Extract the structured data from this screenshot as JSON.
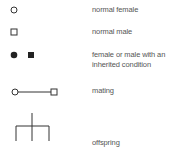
{
  "legend": {
    "items": [
      {
        "symbol": "open-circle",
        "label": "normal female"
      },
      {
        "symbol": "open-square",
        "label": "normal male"
      },
      {
        "symbol": "filled-circle-and-square",
        "label_line1": "female or male with an",
        "label_line2": "inherited condition"
      },
      {
        "symbol": "circle-line-square",
        "label": "mating"
      },
      {
        "symbol": "offspring-bracket",
        "label": "offspring"
      }
    ]
  },
  "colors": {
    "stroke": "#333333",
    "fill": "#222222",
    "text": "#555555"
  }
}
